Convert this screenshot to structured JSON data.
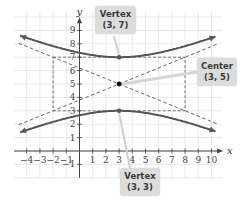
{
  "chart_data": {
    "type": "line",
    "title": "",
    "xlabel": "x",
    "ylabel": "y",
    "x_ticks": [
      -4,
      -3,
      -2,
      -1,
      1,
      2,
      3,
      4,
      5,
      6,
      7,
      8,
      9,
      10
    ],
    "y_ticks": [
      -1,
      1,
      2,
      3,
      4,
      5,
      6,
      7,
      8,
      9
    ],
    "xlim": [
      -5,
      10.5
    ],
    "ylim": [
      -2,
      10.5
    ],
    "grid": true,
    "equation": "(y-5)^2/4 - (x-3)^2/25 = 1",
    "center": [
      3,
      5
    ],
    "vertices": [
      [
        3,
        7
      ],
      [
        3,
        3
      ]
    ],
    "asymptote_slopes": [
      0.4,
      -0.4
    ],
    "rectangle": {
      "x": [
        -2,
        8
      ],
      "y": [
        3,
        7
      ]
    },
    "series": [
      {
        "name": "upper branch",
        "style": "solid",
        "x_range": [
          -4.5,
          10.5
        ]
      },
      {
        "name": "lower branch",
        "style": "solid",
        "x_range": [
          -4.5,
          10.5
        ]
      },
      {
        "name": "asymptote 1",
        "style": "dashed",
        "slope": 0.4,
        "through": [
          3,
          5
        ]
      },
      {
        "name": "asymptote 2",
        "style": "dashed",
        "slope": -0.4,
        "through": [
          3,
          5
        ]
      },
      {
        "name": "central rectangle",
        "style": "dashed"
      }
    ],
    "annotations": [
      {
        "label": "Vertex",
        "coords": "(3, 7)",
        "point": [
          3,
          7
        ]
      },
      {
        "label": "Center",
        "coords": "(3, 5)",
        "point": [
          3,
          5
        ]
      },
      {
        "label": "Vertex",
        "coords": "(3, 3)",
        "point": [
          3,
          3
        ]
      }
    ]
  },
  "axes": {
    "x_label": "x",
    "y_label": "y"
  },
  "callouts": {
    "top_vertex": {
      "title": "Vertex",
      "coords": "(3, 7)"
    },
    "center": {
      "title": "Center",
      "coords": "(3, 5)"
    },
    "bottom_vertex": {
      "title": "Vertex",
      "coords": "(3, 3)"
    }
  },
  "colors": {
    "curve": "#555555",
    "grid": "#e2e2e2",
    "axis": "#444444",
    "callout_bg": "#dcdcdc"
  }
}
